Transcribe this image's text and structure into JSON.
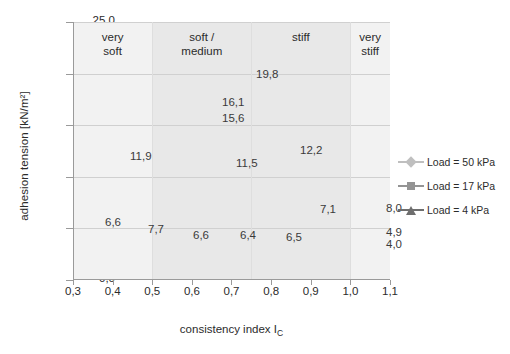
{
  "chart_data": {
    "type": "line",
    "title": "",
    "xlabel": "consistency index I_C",
    "xlabel_main": "consistency index I",
    "xlabel_sub": "C",
    "ylabel": "adhesion tension [kN/m²]",
    "xlim": [
      0.3,
      1.1
    ],
    "ylim": [
      0.0,
      25.0
    ],
    "xticks": [
      "0,3",
      "0,4",
      "0,5",
      "0,6",
      "0,7",
      "0,8",
      "0,9",
      "1,0",
      "1,1"
    ],
    "xtick_values": [
      0.3,
      0.4,
      0.5,
      0.6,
      0.7,
      0.8,
      0.9,
      1.0,
      1.1
    ],
    "yticks": [
      "0,0",
      "5,0",
      "10,0",
      "15,0",
      "20,0",
      "25,0"
    ],
    "ytick_values": [
      0,
      5,
      10,
      15,
      20,
      25
    ],
    "grid": "horizontal",
    "legend_position": "right",
    "decimal_separator": ",",
    "zones": [
      {
        "label": "very\nsoft",
        "from": 0.3,
        "to": 0.5,
        "shade": "#f2f2f2"
      },
      {
        "label": "soft /\nmedium",
        "from": 0.5,
        "to": 0.75,
        "shade": "#e8e8e8"
      },
      {
        "label": "stiff",
        "from": 0.75,
        "to": 1.0,
        "shade": "#e8e8e8"
      },
      {
        "label": "very\nstiff",
        "from": 1.0,
        "to": 1.1,
        "shade": "#f2f2f2"
      }
    ],
    "series": [
      {
        "name": "Load = 50 kPa",
        "marker": "diamond",
        "color": "#bfbfbf",
        "x": [
          0.66,
          0.745,
          0.93,
          1.06
        ],
        "values": [
          16.1,
          19.8,
          12.2,
          8.0
        ],
        "labels": [
          "16,1",
          "19,8",
          "12,2",
          "8,0"
        ]
      },
      {
        "name": "Load = 17 kPa",
        "marker": "square",
        "color": "#949494",
        "x": [
          0.5,
          0.66,
          0.745,
          0.93,
          1.06
        ],
        "values": [
          11.9,
          15.6,
          11.5,
          7.1,
          4.9
        ],
        "labels": [
          "11,9",
          "15,6",
          "11,5",
          "7,1",
          "4,9"
        ]
      },
      {
        "name": "Load = 4 kPa",
        "marker": "triangle",
        "color": "#6e6e6e",
        "x": [
          0.4,
          0.5,
          0.66,
          0.745,
          0.93,
          1.06
        ],
        "values": [
          6.6,
          7.7,
          6.6,
          6.4,
          6.5,
          4.0
        ],
        "labels": [
          "6,6",
          "7,7",
          "6,6",
          "6,4",
          "6,5",
          "4,0"
        ]
      }
    ],
    "data_labels": [
      {
        "text": "19,8",
        "x": 256,
        "y": 68
      },
      {
        "text": "16,1",
        "x": 222,
        "y": 96
      },
      {
        "text": "15,6",
        "x": 222,
        "y": 112
      },
      {
        "text": "11,9",
        "x": 130,
        "y": 150
      },
      {
        "text": "11,5",
        "x": 236,
        "y": 157
      },
      {
        "text": "12,2",
        "x": 300,
        "y": 144
      },
      {
        "text": "8,0",
        "x": 386,
        "y": 202
      },
      {
        "text": "7,1",
        "x": 320,
        "y": 203
      },
      {
        "text": "4,9",
        "x": 386,
        "y": 226
      },
      {
        "text": "4,0",
        "x": 386,
        "y": 238
      },
      {
        "text": "6,6",
        "x": 105,
        "y": 216
      },
      {
        "text": "7,7",
        "x": 148,
        "y": 223
      },
      {
        "text": "6,6",
        "x": 193,
        "y": 229
      },
      {
        "text": "6,4",
        "x": 240,
        "y": 229
      },
      {
        "text": "6,5",
        "x": 286,
        "y": 231
      }
    ]
  },
  "legend": {
    "items": [
      {
        "label": "Load = 50 kPa",
        "color": "#bfbfbf",
        "marker": "diamond"
      },
      {
        "label": "Load = 17 kPa",
        "color": "#949494",
        "marker": "square"
      },
      {
        "label": "Load = 4 kPa",
        "color": "#6e6e6e",
        "marker": "triangle"
      }
    ]
  },
  "axes": {
    "y_title": "adhesion tension [kN/m²]",
    "x_title_main": "consistency index I",
    "x_title_sub": "C"
  }
}
